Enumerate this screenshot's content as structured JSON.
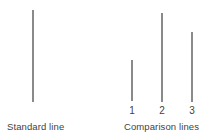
{
  "figure": {
    "background_color": "#ffffff",
    "line_color": "#8a8a8a",
    "text_color": "#3f3f3f"
  },
  "standard_panel": {
    "caption": "Standard line",
    "line": {
      "name": "standard-line",
      "x": 32,
      "top": 10,
      "bottom": 102,
      "length_px": 92
    }
  },
  "comparison_panel": {
    "caption": "Comparison lines",
    "lines": [
      {
        "label": "1",
        "x": 131,
        "top": 60,
        "bottom": 101,
        "length_px": 41
      },
      {
        "label": "2",
        "x": 161,
        "top": 13,
        "bottom": 102,
        "length_px": 89
      },
      {
        "label": "3",
        "x": 191,
        "top": 32,
        "bottom": 102,
        "length_px": 70
      }
    ]
  },
  "chart_data": {
    "type": "bar",
    "title": "",
    "subtitle": "",
    "xlabel": "",
    "ylabel": "",
    "orientation": "vertical",
    "grid": false,
    "legend": false,
    "categories": [
      "Standard",
      "1",
      "2",
      "3"
    ],
    "values": [
      92,
      41,
      89,
      70
    ],
    "group_labels": [
      "Standard line",
      "Comparison lines"
    ],
    "ylim": [
      0,
      100
    ],
    "annotations": [
      "Standard line",
      "Comparison lines",
      "1",
      "2",
      "3"
    ]
  }
}
